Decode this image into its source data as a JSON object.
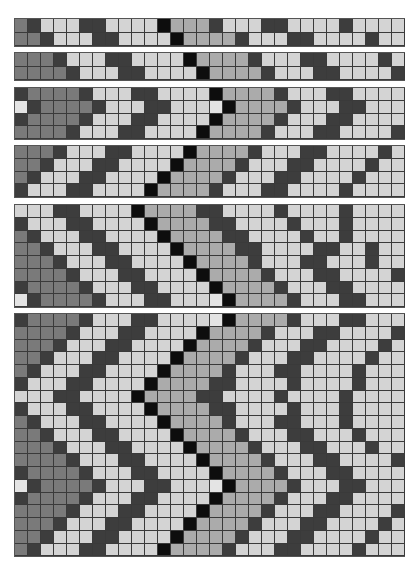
{
  "palette": {
    "K": "#0d0d0d",
    "D": "#3d3d3d",
    "M": "#7a7a7a",
    "G": "#ababab",
    "L": "#d4d4d4",
    "W": "#e4e4e4"
  },
  "panels": [
    {
      "top": 18,
      "row_height": 13.5,
      "rows": [
        "MDLLLDDLLLLKGGGDLLLDDLLLLDLLLL",
        "MMDLLLDDLLLLKGGGGDLLLDDLLLLDLL"
      ]
    },
    {
      "top": 52,
      "row_height": 13.5,
      "rows": [
        "MMMDLLLDDLLLLKGGGGDLLLDDLLLLDL",
        "MMMMDLLLDDLLLLKGGGGDLLLDDLLLLD"
      ]
    },
    {
      "top": 87,
      "row_height": 12.75,
      "rows": [
        "DMMMMDLLLDDLLLLKGGGGDLLLDDLLLL",
        "WDMMMMDLLLDDLLLWKGGGGDLLLDDLLL",
        "DMMMMDLLLDDLLLLKGGGGDLLLDDLLLL",
        "MMMMDLLLDDLLLLKGGGGDLLLDDLLLLD"
      ]
    },
    {
      "top": 145,
      "row_height": 12.75,
      "rows": [
        "MMMDLLLDDLLLLKGGGGDLLLDDLLLLDL",
        "MMDLLLDDLLLLKGGGGDLLLDDLLLLDLL",
        "MDLLLDDLLLLKGGGGDLLLDDLLLLDLLL",
        "DLLLDDLLLLKGGGGDLLLDDLLLLDLLLL"
      ]
    },
    {
      "top": 204,
      "row_height": 12.75,
      "rows": [
        "LLLDDLLLLKGGGGDDLLLLDLLLLDLLLL",
        "DLLLDDLLLLKGGGGDDLLLLDLLLDLLLL",
        "MDLLLDDLLLLKGGGGDDLLLLDLLDLLLL",
        "MMDLLLDDLLLLKGGGGDDLLLLDDLLDLL",
        "MMMDLLLDDLLLLKGGGGDLLLDDLLLDLL",
        "MMMMDLLLDDLLLLKGGGGDLLLDDLLLLD",
        "DMMMMDLLLDDLLLLKGGGGDLLLDDLLLL",
        "WDMMMMDLLLDDLLLWKGGGGDLLLDDLLL"
      ]
    },
    {
      "top": 313,
      "row_height": 12.75,
      "rows": [
        "DMMMMDLLLDDLLLLWKGGGGDLLLDDLLL",
        "MMMMDLLLDDLLLLKGGGGDLLLDDLLLLD",
        "MMMDLLLDDLLLLKGGGGDLLLDDLLLLDL",
        "MMDLLLDDLLLLKGGGGDLLLDDLLLLDLL",
        "MDLLLDDLLLLKGGGGDLLLDDLLLLDLLL",
        "DLLLDDLLLLKGGGGDDLLLLDLLLLDLLL",
        "LLLDDLLLLKGGGGDDLLLLDLLLLDLLLL",
        "DLLLDDLLLLKGGGGDDLLLLDLLLDLLLL",
        "MDLLLDDLLLLKGGGGDLLLDDLLLDLLLL",
        "MMDLLLDDLLLLKGGGGDLLLDDLLLDLLL",
        "MMMDLLLDDLLLLKGGGGDLLLDDLLLDLL",
        "MMMMDLLLDDLLLLKGGGGDLLLDDLLLLD",
        "DMMMMDLLLDDLLLLKGGGGDLLLDDLLLL",
        "WDMMMMDLLLDDLLLWKGGGGDLLLDDLLL",
        "DMMMMDLLLDDLLLLKGGGGDLLLDDLLLL",
        "MMMMDLLLDDLLLLKGGGGDLLLDDLLLLD",
        "MMMDLLLDDLLLLKGGGGDLLLDDLLLLDL",
        "MMDLLLDDLLLLKGGGGDLLLDDLLLLDLL",
        "MDLLLDDLLLLKGGGGDLLLDDLLLLDLLL"
      ]
    }
  ]
}
